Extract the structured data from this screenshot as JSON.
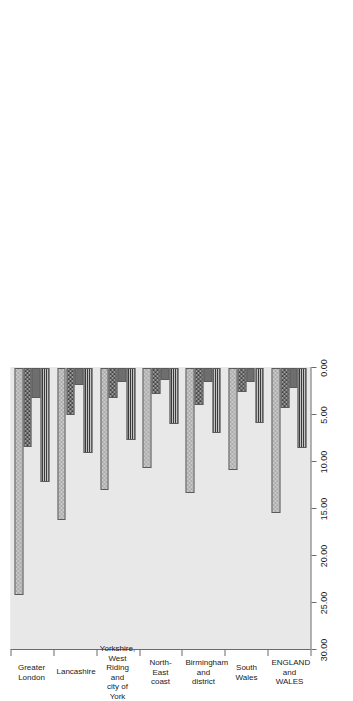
{
  "chart_data": {
    "type": "bar",
    "orientation": "horizontal-rotated",
    "title": "",
    "xlabel": "",
    "ylabel": "",
    "categories": [
      "Greater\nLondon",
      "Lancashire",
      "Yorkshire, West\nRiding and\ncity of York",
      "North-East\ncoast",
      "Birmingham\nand district",
      "South\nWales",
      "ENGLAND\nand WALES"
    ],
    "category_lines": [
      [
        "Greater",
        "London"
      ],
      [
        "Lancashire"
      ],
      [
        "Yorkshire, West",
        "Riding and",
        "city of York"
      ],
      [
        "North-East",
        "coast"
      ],
      [
        "Birmingham",
        "and district"
      ],
      [
        "South",
        "Wales"
      ],
      [
        "ENGLAND",
        "and WALES"
      ]
    ],
    "value_axis": {
      "min": 0.0,
      "max": 30.0,
      "tick_values": [
        0.0,
        5.0,
        10.0,
        15.0,
        20.0,
        25.0,
        30.0
      ],
      "tick_labels": [
        "0.00",
        "5.00",
        "10.00",
        "15.00",
        "20.00",
        "25.00",
        "30.00"
      ],
      "direction": "decreasing-left-to-right"
    },
    "series": [
      {
        "name": "series-1",
        "pattern": "light-checkerboard",
        "color": "#c9c9c9",
        "values": [
          24.1,
          16.2,
          13.0,
          10.6,
          13.3,
          10.9,
          15.4
        ]
      },
      {
        "name": "series-2",
        "pattern": "dark-checkerboard",
        "color": "#3f3f3f",
        "values": [
          8.4,
          5.0,
          3.2,
          2.8,
          3.9,
          2.6,
          4.3
        ]
      },
      {
        "name": "series-3",
        "pattern": "solid-dark-grey",
        "color": "#6e6e6e",
        "values": [
          3.2,
          1.8,
          1.5,
          1.3,
          1.5,
          1.5,
          2.1
        ]
      },
      {
        "name": "series-4",
        "pattern": "horizontal-stripes",
        "color": "#3a3a3a",
        "values": [
          12.1,
          9.0,
          7.7,
          6.0,
          6.9,
          5.9,
          8.5
        ]
      }
    ],
    "grid": false,
    "legend": "none",
    "plot_background": "#e8e8e8",
    "figure_background": "#ffffff",
    "axis_color": "#6b6b6b"
  }
}
